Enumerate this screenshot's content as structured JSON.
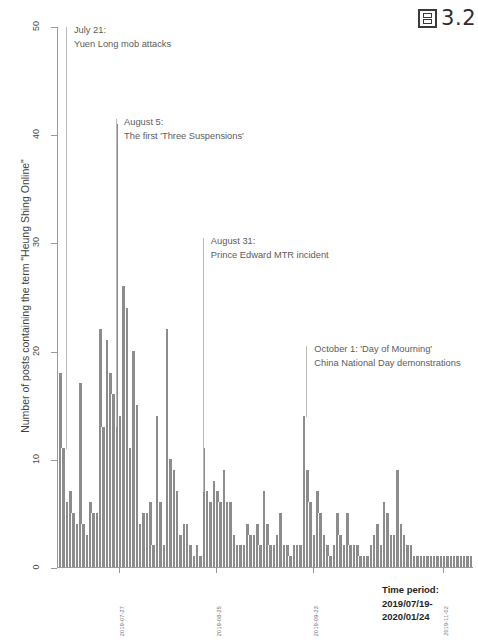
{
  "figure": {
    "label_glyph": "figure-icon",
    "label_text": "3.2"
  },
  "chart_data": {
    "type": "bar",
    "title": "",
    "xlabel": "",
    "ylabel": "Number of posts containing the term \"Heung Shing Online\"",
    "ylim": [
      0,
      50
    ],
    "yticks": [
      0,
      10,
      20,
      30,
      40,
      50
    ],
    "grid": false,
    "legend": null,
    "x_tick_labels": [
      "2019-07-27",
      "2019-08-25",
      "2019-09-23",
      "2019-11-02"
    ],
    "x_tick_positions": [
      18,
      47,
      76,
      115
    ],
    "time_period": {
      "heading": "Time period:",
      "line1": "2019/07/19-",
      "line2": "2020/01/24"
    },
    "annotations": [
      {
        "date_line": "July 21:",
        "event_line": "Yuen Long mob attacks",
        "x_index": 2,
        "line_top_value": 50,
        "line_bottom_value": 11
      },
      {
        "date_line": "August 5:",
        "event_line": "The first 'Three Suspensions'",
        "x_index": 17,
        "line_top_value": 41.5,
        "line_bottom_value": 13
      },
      {
        "date_line": "August 31:",
        "event_line": "Prince Edward MTR incident",
        "x_index": 43,
        "line_top_value": 30.5,
        "line_bottom_value": 7
      },
      {
        "date_line": "October 1: 'Day of Mourning'",
        "event_line": "China National Day demonstrations",
        "x_index": 74,
        "line_top_value": 20.5,
        "line_bottom_value": 14
      }
    ],
    "values": [
      18,
      11,
      6,
      7,
      5,
      4,
      17,
      4,
      3,
      6,
      5,
      5,
      22,
      13,
      21,
      18,
      16,
      41,
      14,
      26,
      24,
      11,
      20,
      15,
      4,
      5,
      5,
      6,
      2,
      14,
      6,
      2,
      22,
      10,
      9,
      7,
      3,
      4,
      4,
      2,
      1,
      2,
      1,
      11,
      7,
      6,
      8,
      7,
      6,
      9,
      6,
      6,
      3,
      2,
      2,
      2,
      4,
      3,
      3,
      4,
      2,
      7,
      4,
      2,
      2,
      3,
      5,
      2,
      2,
      1,
      2,
      2,
      2,
      14,
      9,
      6,
      3,
      7,
      5,
      3,
      2,
      1,
      2,
      5,
      3,
      2,
      5,
      2,
      2,
      2,
      1,
      1,
      1,
      2,
      3,
      4,
      2,
      6,
      5,
      3,
      3,
      9,
      4,
      3,
      2,
      2,
      1,
      1,
      1,
      1,
      1,
      1,
      1,
      1,
      1,
      1,
      1,
      1,
      1,
      1,
      1,
      1,
      1,
      1
    ]
  }
}
